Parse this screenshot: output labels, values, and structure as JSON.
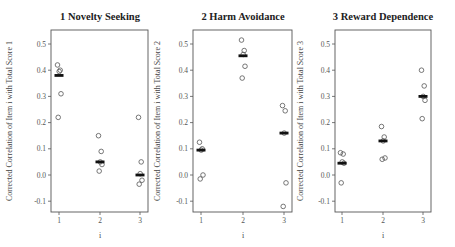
{
  "chart_data": [
    {
      "type": "scatter",
      "title": "1 Novelty Seeking",
      "xlabel": "i",
      "ylabel": "Corrected Correlation of Item i with Total Score 1",
      "x_ticks": [
        "1",
        "2",
        "3"
      ],
      "y_ticks": [
        "0.5",
        "0.4",
        "0.3",
        "0.2",
        "0.1",
        "0.0",
        "-0.1"
      ],
      "ylim": [
        -0.14,
        0.55
      ],
      "grid": false,
      "points": [
        {
          "x": 1,
          "values": [
            0.42,
            0.4,
            0.395,
            0.31,
            0.22
          ],
          "median": 0.38
        },
        {
          "x": 2,
          "values": [
            0.15,
            0.09,
            0.05,
            0.04,
            0.015
          ],
          "median": 0.05
        },
        {
          "x": 3,
          "values": [
            0.22,
            0.05,
            0.005,
            -0.02,
            -0.035
          ],
          "median": 0.0
        }
      ]
    },
    {
      "type": "scatter",
      "title": "2 Harm Avoidance",
      "xlabel": "i",
      "ylabel": "Corrected Correlation of Item i with Total Score 2",
      "x_ticks": [
        "1",
        "2",
        "3"
      ],
      "y_ticks": [
        "0.5",
        "0.4",
        "0.3",
        "0.2",
        "0.1",
        "0.0",
        "-0.1"
      ],
      "ylim": [
        -0.14,
        0.55
      ],
      "grid": false,
      "points": [
        {
          "x": 1,
          "values": [
            0.125,
            0.1,
            0.095,
            0.0,
            -0.015
          ],
          "median": 0.095
        },
        {
          "x": 2,
          "values": [
            0.515,
            0.475,
            0.46,
            0.415,
            0.37
          ],
          "median": 0.455
        },
        {
          "x": 3,
          "values": [
            0.265,
            0.245,
            0.16,
            -0.03,
            -0.12
          ],
          "median": 0.16
        }
      ]
    },
    {
      "type": "scatter",
      "title": "3 Reward Dependence",
      "xlabel": "i",
      "ylabel": "Corrected Correlation of Item i with Total Score 3",
      "x_ticks": [
        "1",
        "2",
        "3"
      ],
      "y_ticks": [
        "0.5",
        "0.4",
        "0.3",
        "0.2",
        "0.1",
        "0.0",
        "-0.1"
      ],
      "ylim": [
        -0.14,
        0.55
      ],
      "grid": false,
      "points": [
        {
          "x": 1,
          "values": [
            0.085,
            0.08,
            0.05,
            0.045,
            -0.03
          ],
          "median": 0.045
        },
        {
          "x": 2,
          "values": [
            0.185,
            0.145,
            0.13,
            0.065,
            0.06
          ],
          "median": 0.13
        },
        {
          "x": 3,
          "values": [
            0.4,
            0.34,
            0.3,
            0.285,
            0.215
          ],
          "median": 0.3
        }
      ]
    }
  ],
  "colors": {
    "axis": "#555555",
    "marker": "#555555",
    "median": "#111111"
  }
}
